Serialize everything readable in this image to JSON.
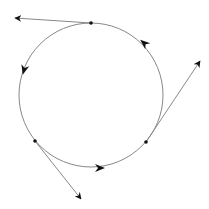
{
  "diagram": {
    "background": "#ffffff",
    "stroke_color": "#888888",
    "arrow_color": "#111111",
    "dot_color": "#111111",
    "circle": {
      "cx": 91,
      "cy": 95,
      "r": 72
    },
    "points": [
      {
        "name": "top",
        "x": 91,
        "y": 23
      },
      {
        "name": "lower-left",
        "x": 35,
        "y": 141
      },
      {
        "name": "lower-right",
        "x": 146,
        "y": 142
      }
    ],
    "tangent_lines": [
      {
        "from": [
          91,
          23
        ],
        "to": [
          15,
          18
        ]
      },
      {
        "from": [
          146,
          142
        ],
        "to": [
          200,
          61
        ]
      },
      {
        "from": [
          35,
          141
        ],
        "to": [
          81,
          199
        ]
      }
    ],
    "circle_arrowheads": [
      {
        "x": 24,
        "y": 70,
        "angle": 105
      },
      {
        "x": 144,
        "y": 43,
        "angle": 220
      },
      {
        "x": 100,
        "y": 168,
        "angle": 0
      }
    ]
  }
}
